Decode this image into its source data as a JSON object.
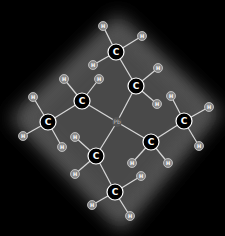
{
  "molecule": {
    "name": "Tetraethyllead",
    "center": {
      "label": "Pb",
      "x": 117,
      "y": 122
    },
    "carbons": [
      {
        "id": "c1",
        "label": "C",
        "x": 116,
        "y": 52
      },
      {
        "id": "c2",
        "label": "C",
        "x": 136,
        "y": 86
      },
      {
        "id": "c3",
        "label": "C",
        "x": 82,
        "y": 101
      },
      {
        "id": "c4",
        "label": "C",
        "x": 48,
        "y": 122
      },
      {
        "id": "c5",
        "label": "C",
        "x": 151,
        "y": 142
      },
      {
        "id": "c6",
        "label": "C",
        "x": 184,
        "y": 121
      },
      {
        "id": "c7",
        "label": "C",
        "x": 96,
        "y": 156
      },
      {
        "id": "c8",
        "label": "C",
        "x": 115,
        "y": 192
      }
    ],
    "hydrogens": [
      {
        "label": "H",
        "x": 103,
        "y": 26,
        "bond": "c1"
      },
      {
        "label": "H",
        "x": 142,
        "y": 36,
        "bond": "c1"
      },
      {
        "label": "H",
        "x": 93,
        "y": 65,
        "bond": "c1"
      },
      {
        "label": "H",
        "x": 158,
        "y": 68,
        "bond": "c2"
      },
      {
        "label": "H",
        "x": 157,
        "y": 104,
        "bond": "c2"
      },
      {
        "label": "H",
        "x": 64,
        "y": 79,
        "bond": "c3"
      },
      {
        "label": "H",
        "x": 99,
        "y": 79,
        "bond": "c3"
      },
      {
        "label": "H",
        "x": 33,
        "y": 97,
        "bond": "c4"
      },
      {
        "label": "H",
        "x": 23,
        "y": 136,
        "bond": "c4"
      },
      {
        "label": "H",
        "x": 62,
        "y": 147,
        "bond": "c4"
      },
      {
        "label": "H",
        "x": 171,
        "y": 96,
        "bond": "c6"
      },
      {
        "label": "H",
        "x": 209,
        "y": 107,
        "bond": "c6"
      },
      {
        "label": "H",
        "x": 199,
        "y": 146,
        "bond": "c6"
      },
      {
        "label": "H",
        "x": 132,
        "y": 163,
        "bond": "c5"
      },
      {
        "label": "H",
        "x": 168,
        "y": 163,
        "bond": "c5"
      },
      {
        "label": "H",
        "x": 75,
        "y": 137,
        "bond": "c7"
      },
      {
        "label": "H",
        "x": 75,
        "y": 174,
        "bond": "c7"
      },
      {
        "label": "H",
        "x": 141,
        "y": 176,
        "bond": "c8"
      },
      {
        "label": "H",
        "x": 92,
        "y": 205,
        "bond": "c8"
      },
      {
        "label": "H",
        "x": 130,
        "y": 216,
        "bond": "c8"
      }
    ],
    "cc_bonds": [
      [
        "c1",
        "c2"
      ],
      [
        "c3",
        "c4"
      ],
      [
        "c5",
        "c6"
      ],
      [
        "c7",
        "c8"
      ]
    ],
    "pb_bonds": [
      "c2",
      "c3",
      "c5",
      "c7"
    ]
  },
  "colors": {
    "background": "#000000",
    "glow": "#5a5a5a",
    "bond": "#d8d8d8",
    "carbon_fill": "#000000",
    "carbon_stroke": "#ffffff",
    "hydrogen_fill": "#8a8a8a",
    "hydrogen_stroke": "#d0d0d0"
  }
}
